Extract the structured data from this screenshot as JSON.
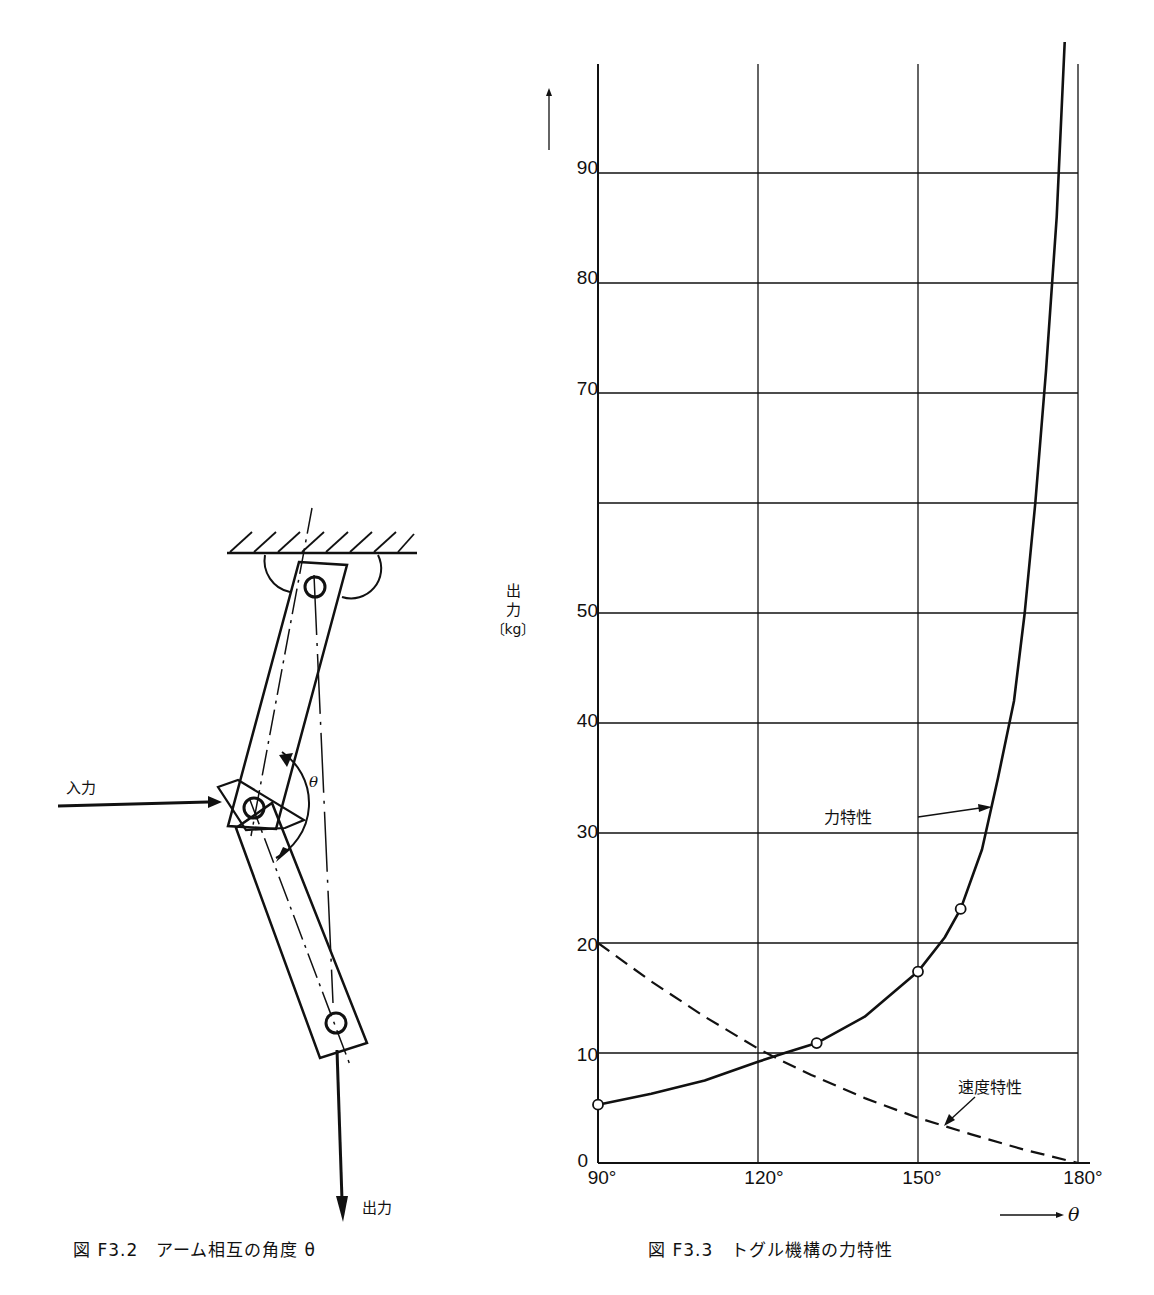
{
  "figure_left": {
    "caption": "図 F3.2　アーム相互の角度 θ",
    "labels": {
      "input": "入力",
      "output": "出力",
      "angle": "θ"
    }
  },
  "figure_right": {
    "caption": "図 F3.3　トグル機構の力特性",
    "y_axis_label_lines": [
      "出",
      "力",
      "〔kg〕"
    ],
    "x_axis_arrow_label": "θ",
    "annotations": {
      "force": "力特性",
      "speed": "速度特性"
    },
    "y_ticks": [
      "0",
      "10",
      "20",
      "30",
      "40",
      "50",
      "70",
      "80",
      "90"
    ],
    "x_ticks": [
      "90°",
      "120°",
      "150°",
      "180°"
    ]
  },
  "chart_data": {
    "type": "line",
    "title": "トグル機構の力特性",
    "xlabel": "θ",
    "ylabel": "出力〔kg〕",
    "xlim": [
      90,
      180
    ],
    "ylim": [
      0,
      100
    ],
    "grid": true,
    "x_ticks": [
      90,
      120,
      150,
      180
    ],
    "y_ticks": [
      0,
      10,
      20,
      30,
      40,
      50,
      60,
      70,
      80,
      90
    ],
    "y_tick_labels_shown": [
      "0",
      "10",
      "20",
      "30",
      "40",
      "50",
      "70",
      "80",
      "90"
    ],
    "series": [
      {
        "name": "力特性",
        "style": "solid",
        "markers": [
          {
            "x": 90,
            "y": 5.3
          },
          {
            "x": 131,
            "y": 10.9
          },
          {
            "x": 150,
            "y": 17.4
          },
          {
            "x": 158,
            "y": 23.1
          }
        ],
        "x": [
          90,
          100,
          110,
          120,
          125,
          131,
          140,
          150,
          155,
          158,
          162,
          165,
          168,
          170,
          172,
          174,
          176,
          177.5
        ],
        "y": [
          5.3,
          6.3,
          7.5,
          9.2,
          10.0,
          10.9,
          13.3,
          17.4,
          20.5,
          23.1,
          28.5,
          35,
          42,
          50,
          60,
          72,
          86,
          102
        ]
      },
      {
        "name": "速度特性",
        "style": "dashed",
        "x": [
          90,
          100,
          110,
          120,
          124,
          130,
          140,
          150,
          160,
          170,
          180
        ],
        "y": [
          20,
          16.5,
          13.3,
          10.4,
          9.4,
          8.0,
          5.9,
          4.1,
          2.6,
          1.2,
          0
        ]
      }
    ]
  }
}
